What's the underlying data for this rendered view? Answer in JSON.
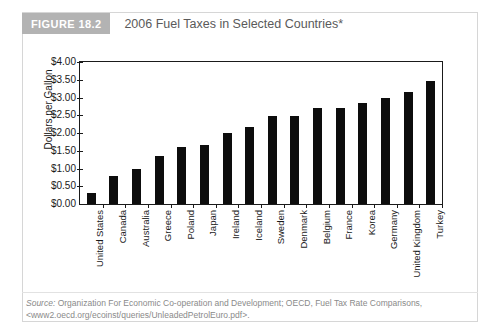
{
  "figure": {
    "badge": "FIGURE 18.2",
    "title": "2006 Fuel Taxes in Selected Countries*"
  },
  "source": {
    "label": "Source:",
    "text": " Organization For Economic Co-operation and Development; OECD, Fuel Tax Rate Comparisons,",
    "url": "<www2.oecd.org/ecoinst/queries/UnleadedPetrolEuro.pdf>."
  },
  "chart_data": {
    "type": "bar",
    "title": "2006 Fuel Taxes in Selected Countries*",
    "xlabel": "",
    "ylabel": "Dollars per Gallon",
    "ylim": [
      0,
      4
    ],
    "ytick_step": 0.5,
    "ytick_labels": [
      "$0.00",
      "$0.50",
      "$1.00",
      "$1.50",
      "$2.00",
      "$2.50",
      "$3.00",
      "$3.50",
      "$4.00"
    ],
    "ytick_values": [
      0,
      0.5,
      1.0,
      1.5,
      2.0,
      2.5,
      3.0,
      3.5,
      4.0
    ],
    "grid": false,
    "legend": false,
    "bar_color": "#0d0d0d",
    "categories": [
      "United States",
      "Canada",
      "Australia",
      "Greece",
      "Poland",
      "Japan",
      "Ireland",
      "Iceland",
      "Sweden",
      "Denmark",
      "Belgium",
      "France",
      "Korea",
      "Germany",
      "United Kingdom",
      "Turkey"
    ],
    "values": [
      0.32,
      0.78,
      1.0,
      1.35,
      1.62,
      1.66,
      2.0,
      2.18,
      2.47,
      2.49,
      2.7,
      2.7,
      2.84,
      2.98,
      3.15,
      3.47
    ]
  }
}
